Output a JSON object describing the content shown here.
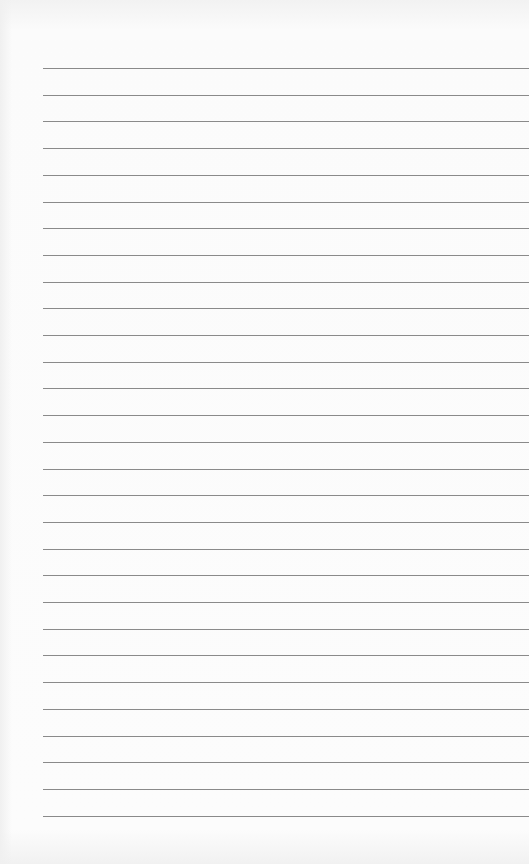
{
  "page": {
    "type": "lined-paper",
    "line_count": 29,
    "first_line_y": 68,
    "line_spacing": 26.7,
    "line_left_x": 43,
    "line_color": "#8a8a8a",
    "background_color": "#fbfbfb"
  }
}
